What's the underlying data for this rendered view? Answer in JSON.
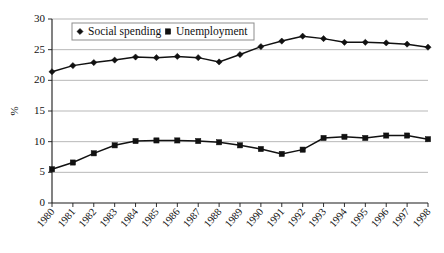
{
  "chart_data": {
    "type": "line",
    "title": "",
    "xlabel": "",
    "ylabel": "%",
    "ylim": [
      0,
      30
    ],
    "yticks": [
      0,
      5,
      10,
      15,
      20,
      25,
      30
    ],
    "ytick_labels": [
      "0",
      "5",
      "10",
      "15",
      "20",
      "25",
      "30"
    ],
    "grid": true,
    "legend_position": "top-left-inside",
    "categories": [
      "1980",
      "1981",
      "1982",
      "1983",
      "1984",
      "1985",
      "1986",
      "1987",
      "1988",
      "1989",
      "1990",
      "1991",
      "1992",
      "1993",
      "1994",
      "1995",
      "1996",
      "1997",
      "1998"
    ],
    "series": [
      {
        "name": "Social spending",
        "marker": "diamond",
        "values": [
          21.4,
          22.4,
          22.9,
          23.3,
          23.8,
          23.7,
          23.9,
          23.7,
          23.0,
          24.2,
          25.5,
          26.4,
          27.2,
          26.8,
          26.2,
          26.2,
          26.1,
          25.9,
          25.4
        ]
      },
      {
        "name": "Unemployment",
        "marker": "square",
        "values": [
          5.5,
          6.6,
          8.1,
          9.4,
          10.1,
          10.2,
          10.2,
          10.1,
          9.9,
          9.4,
          8.8,
          8.0,
          8.7,
          10.6,
          10.8,
          10.6,
          11.0,
          11.0,
          10.4
        ]
      }
    ],
    "legend": [
      {
        "label": "Social spending",
        "marker": "diamond",
        "color": "#111111"
      },
      {
        "label": "Unemployment",
        "marker": "square",
        "color": "#111111"
      }
    ],
    "colors": {
      "line": "#111111",
      "grid": "#9a9a9a",
      "axis": "#1a1a1a",
      "background": "#ffffff"
    }
  }
}
